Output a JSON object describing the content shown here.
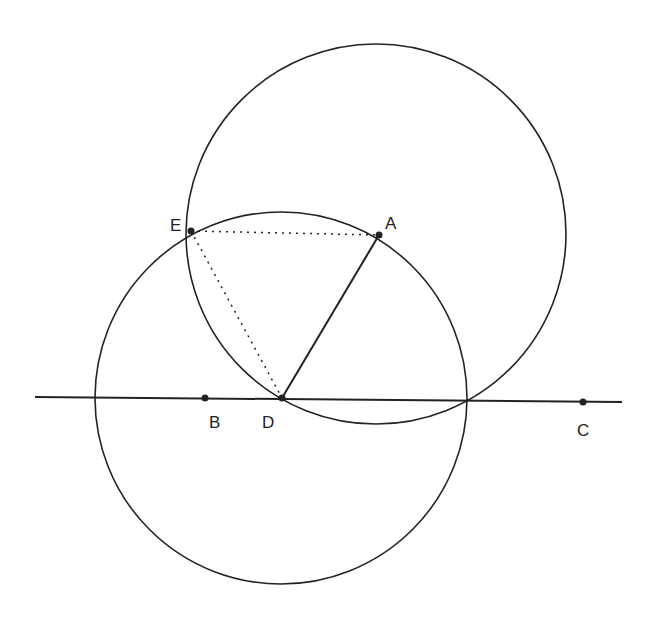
{
  "diagram": {
    "points": [
      {
        "id": "A",
        "label": "A",
        "x": 379,
        "y": 235,
        "lx": 385,
        "ly": 229
      },
      {
        "id": "B",
        "label": "B",
        "x": 205,
        "y": 398,
        "lx": 209,
        "ly": 428
      },
      {
        "id": "C",
        "label": "C",
        "x": 583,
        "y": 402,
        "lx": 577,
        "ly": 436
      },
      {
        "id": "D",
        "label": "D",
        "x": 282,
        "y": 398,
        "lx": 262,
        "ly": 428
      },
      {
        "id": "E",
        "label": "E",
        "x": 191,
        "y": 231,
        "lx": 170,
        "ly": 231
      }
    ],
    "line_BC": {
      "x1": 35,
      "y1": 397,
      "x2": 622,
      "y2": 402
    },
    "circle_centered_A": {
      "cx": 376,
      "cy": 234,
      "r": 190
    },
    "circle_centered_D": {
      "cx": 281,
      "cy": 398,
      "r": 186
    },
    "segment_AD": "solid",
    "segment_EA": "dotted",
    "segment_ED": "dotted"
  }
}
